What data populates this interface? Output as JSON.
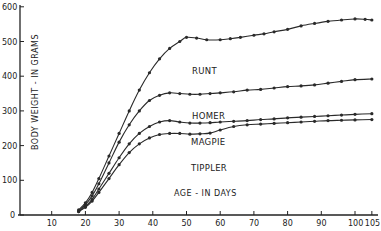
{
  "chart_data": {
    "type": "line",
    "title": "",
    "xlabel": "AGE - IN DAYS",
    "ylabel": "BODY WEIGHT - IN GRAMS",
    "xlim": [
      0,
      105
    ],
    "ylim": [
      0,
      600
    ],
    "x_ticks": [
      10,
      20,
      30,
      40,
      50,
      60,
      70,
      80,
      90,
      100,
      105
    ],
    "y_ticks": [
      0,
      100,
      200,
      300,
      400,
      500,
      600
    ],
    "grid": false,
    "legend": "inline labels",
    "series": [
      {
        "name": "RUNT",
        "x": [
          18,
          20,
          22,
          24,
          27,
          30,
          33,
          36,
          39,
          42,
          45,
          48,
          50,
          53,
          56,
          60,
          63,
          66,
          70,
          73,
          76,
          80,
          84,
          88,
          92,
          96,
          100,
          103,
          105
        ],
        "values": [
          15,
          35,
          65,
          105,
          170,
          235,
          300,
          360,
          410,
          450,
          480,
          500,
          512,
          510,
          505,
          505,
          508,
          512,
          518,
          522,
          528,
          535,
          545,
          552,
          558,
          562,
          565,
          564,
          562
        ]
      },
      {
        "name": "HOMER",
        "x": [
          18,
          20,
          22,
          24,
          27,
          30,
          33,
          36,
          39,
          42,
          45,
          48,
          51,
          54,
          57,
          60,
          64,
          68,
          72,
          76,
          80,
          84,
          88,
          92,
          96,
          100,
          105
        ],
        "values": [
          12,
          30,
          55,
          90,
          150,
          210,
          260,
          300,
          330,
          345,
          352,
          350,
          348,
          348,
          350,
          352,
          355,
          360,
          362,
          366,
          370,
          372,
          375,
          380,
          385,
          390,
          392
        ]
      },
      {
        "name": "MAGPIE",
        "x": [
          18,
          20,
          22,
          24,
          27,
          30,
          33,
          36,
          39,
          42,
          45,
          48,
          51,
          54,
          57,
          60,
          64,
          68,
          72,
          76,
          80,
          84,
          88,
          92,
          96,
          100,
          105
        ],
        "values": [
          10,
          25,
          45,
          75,
          120,
          165,
          205,
          235,
          255,
          268,
          272,
          268,
          265,
          265,
          266,
          268,
          270,
          272,
          275,
          277,
          280,
          282,
          284,
          286,
          288,
          290,
          292
        ]
      },
      {
        "name": "TIPPLER",
        "x": [
          18,
          20,
          22,
          24,
          27,
          30,
          33,
          36,
          39,
          42,
          45,
          48,
          51,
          54,
          57,
          60,
          64,
          68,
          72,
          76,
          80,
          84,
          88,
          92,
          96,
          100,
          105
        ],
        "values": [
          10,
          22,
          40,
          65,
          105,
          145,
          180,
          205,
          222,
          232,
          235,
          235,
          233,
          234,
          236,
          245,
          255,
          260,
          262,
          264,
          266,
          268,
          270,
          272,
          273,
          274,
          275
        ]
      }
    ],
    "colors": {
      "line": "#2a2a2a",
      "marker": "#2a2a2a",
      "background": "#ffffff"
    }
  }
}
